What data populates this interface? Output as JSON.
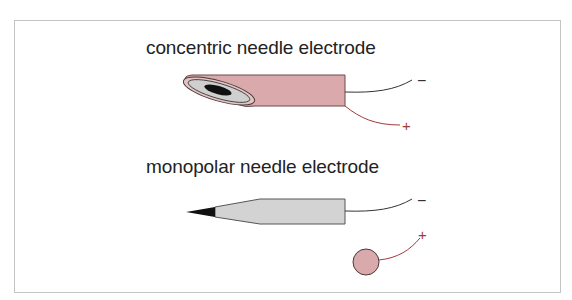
{
  "diagram": {
    "concentric": {
      "title": "concentric needle electrode",
      "negative_label": "−",
      "positive_label": "+",
      "colors": {
        "shaft": "#d9a9ab",
        "outline": "#6e4a4c",
        "insulation": "#c8c8c8",
        "core": "#111111",
        "wire_negative": "#333333",
        "wire_positive": "#a33a3a"
      }
    },
    "monopolar": {
      "title": "monopolar needle electrode",
      "negative_label": "−",
      "positive_label": "+",
      "colors": {
        "shaft": "#d3d3d3",
        "outline": "#555555",
        "tip": "#111111",
        "reference": "#d9a9ab",
        "wire_negative": "#333333",
        "wire_positive": "#a33a3a"
      }
    }
  }
}
